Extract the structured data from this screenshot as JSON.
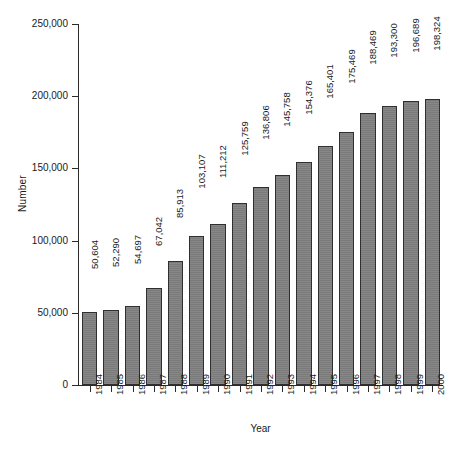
{
  "chart_data": {
    "type": "bar",
    "title": "",
    "xlabel": "Year",
    "ylabel": "Number",
    "categories": [
      "1984",
      "1985",
      "1986",
      "1987",
      "1988",
      "1989",
      "1990",
      "1991",
      "1992",
      "1993",
      "1994",
      "1995",
      "1996",
      "1997",
      "1998",
      "1999",
      "2000"
    ],
    "values": [
      50604,
      52290,
      54697,
      67042,
      85913,
      103107,
      111212,
      125759,
      136806,
      145758,
      154376,
      165401,
      175469,
      188469,
      193300,
      196689,
      198324
    ],
    "value_labels": [
      "50,604",
      "52,290",
      "54,697",
      "67,042",
      "85,913",
      "103,107",
      "111,212",
      "125,759",
      "136,806",
      "145,758",
      "154,376",
      "165,401",
      "175,469",
      "188,469",
      "193,300",
      "196,689",
      "198,324"
    ],
    "ylim": [
      0,
      250000
    ],
    "y_ticks": [
      0,
      50000,
      100000,
      150000,
      200000,
      250000
    ],
    "y_tick_labels": [
      "0",
      "50,000",
      "100,000",
      "150,000",
      "200,000",
      "250,000"
    ],
    "grid": false,
    "legend": null,
    "bar_color": "#808080",
    "bar_border_color": "#2f2f2f",
    "axis_color": "#2b2b2b",
    "background_color": "#ffffff"
  }
}
